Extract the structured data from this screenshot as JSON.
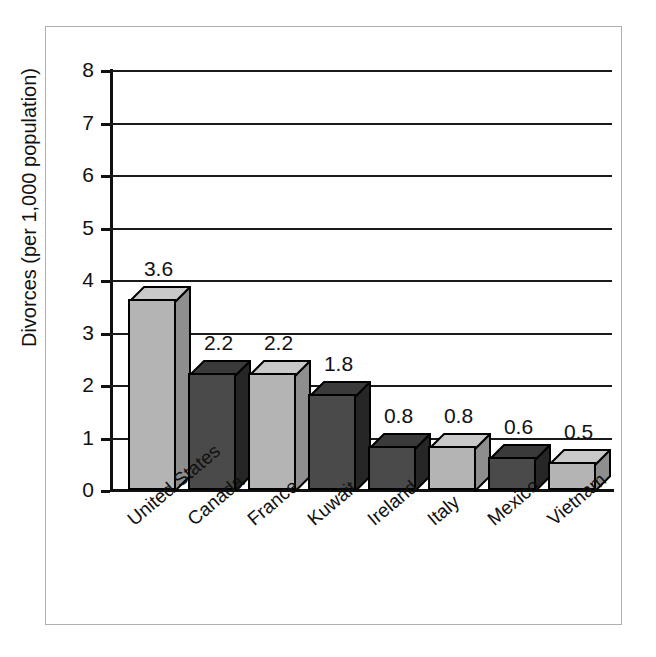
{
  "chart_data": {
    "type": "bar",
    "title": "",
    "xlabel": "",
    "ylabel": "Divorces (per 1,000 population)",
    "categories": [
      "United States",
      "Canada",
      "France",
      "Kuwait",
      "Ireland",
      "Italy",
      "Mexico",
      "Vietnam"
    ],
    "values": [
      3.6,
      2.2,
      2.2,
      1.8,
      0.8,
      0.8,
      0.6,
      0.5
    ],
    "value_labels": [
      "3.6",
      "2.2",
      "2.2",
      "1.8",
      "0.8",
      "0.8",
      "0.6",
      "0.5"
    ],
    "ylim": [
      0,
      8
    ],
    "yticks": [
      0,
      1,
      2,
      3,
      4,
      5,
      6,
      7,
      8
    ],
    "ytick_labels": [
      "0",
      "1",
      "2",
      "3",
      "4",
      "5",
      "6",
      "7",
      "8"
    ],
    "grid": true,
    "grid_axis": "y",
    "legend": "none",
    "bar_style": "3d",
    "bar_shades": [
      "light",
      "dark",
      "light",
      "dark",
      "dark",
      "light",
      "dark",
      "light"
    ],
    "colors": {
      "light_front": "#b4b4b4",
      "light_top": "#c9c9c9",
      "light_side": "#8e8e8e",
      "dark_front": "#4a4a4a",
      "dark_top": "#3a3a3a",
      "dark_side": "#262626",
      "outline": "#000000",
      "gridline": "#1a1a1a",
      "axis": "#101010",
      "frame": "#b0b0b0",
      "text": "#111111",
      "background": "#ffffff"
    }
  }
}
